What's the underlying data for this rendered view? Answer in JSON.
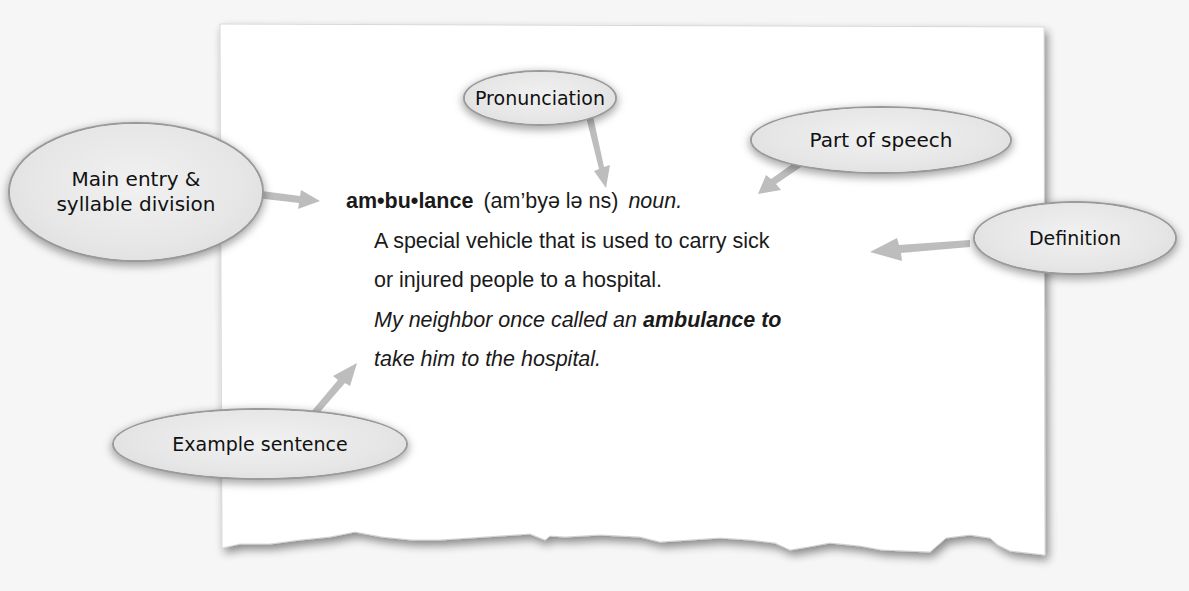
{
  "diagram": {
    "colors": {
      "background": "#f6f6f6",
      "paper": "#ffffff",
      "callout_fill": "#e6e6e6",
      "callout_border": "#9a9a9a",
      "arrow": "#bdbdbd",
      "text": "#1a1a1a"
    }
  },
  "entry": {
    "headword": "am•bu•lance",
    "pronunciation": "(am’byə lə ns)",
    "part_of_speech": "noun.",
    "definition_lines": [
      "A special vehicle that is used to carry sick",
      "or injured people to a hospital."
    ],
    "example": {
      "line1_prefix": "My neighbor once called an ",
      "line1_bold": "ambulance to",
      "line2": "take him to the hospital."
    }
  },
  "callouts": {
    "main_entry": {
      "line1": "Main entry &",
      "line2": "syllable division"
    },
    "pronunciation": {
      "label": "Pronunciation"
    },
    "part_of_speech": {
      "label": "Part of speech"
    },
    "definition": {
      "label": "Definition"
    },
    "example_sentence": {
      "label": "Example sentence"
    }
  }
}
